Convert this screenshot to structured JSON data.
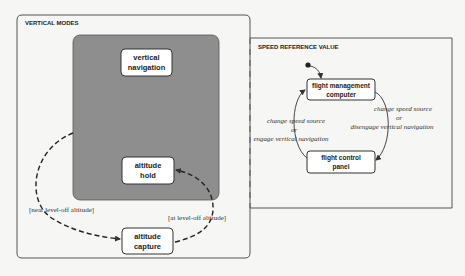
{
  "vertical_modes": {
    "title": "VERTICAL MODES",
    "states": {
      "vertical_navigation": [
        "vertical",
        "navigation"
      ],
      "altitude_hold": [
        "altitude",
        "hold"
      ],
      "altitude_capture": [
        "altitude",
        "capture"
      ]
    },
    "transitions": {
      "near_level_off": "[near level-off altitude]",
      "at_level_off": "[at level-off altitude]"
    }
  },
  "speed_reference": {
    "title": "SPEED REFERENCE  VALUE",
    "states": {
      "fmc": [
        "flight management",
        "computer"
      ],
      "fcp": [
        "flight control",
        "panel"
      ]
    },
    "transitions": {
      "fmc_to_fcp": [
        "change speed source",
        "or",
        "disengage vertical navigation"
      ],
      "fcp_to_fmc": [
        "change speed source",
        "or",
        "engage vertical navigation"
      ]
    }
  },
  "colors": {
    "superstate_fill": "#8e8e8e",
    "line": "#444444",
    "state_fill": "#ffffff"
  }
}
